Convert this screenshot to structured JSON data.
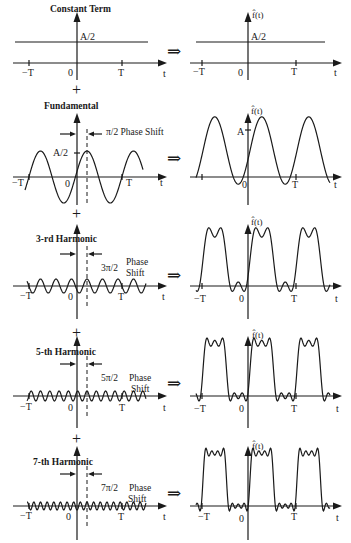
{
  "figure": {
    "colors": {
      "ink": "#1a1a1a",
      "background": "#ffffff"
    },
    "symbols": {
      "plus": "+",
      "implies": "⇒",
      "output_label": "f̂(t)",
      "axis_t": "t"
    },
    "ticks": {
      "neg_T": "−T",
      "zero": "0",
      "pos_T": "T"
    },
    "rows": [
      {
        "title": "Constant Term",
        "amp_label": "A/2",
        "right_amp_label": "A/2",
        "phase": "",
        "phase_word1": "",
        "phase_word2": "",
        "axis_y": 63
      },
      {
        "title": "Fundamental",
        "amp_label": "A/2",
        "right_amp_label": "A",
        "phase": "π/2 Phase Shift",
        "phase_word1": "",
        "phase_word2": "",
        "axis_y": 177
      },
      {
        "title": "3-rd Harmonic",
        "amp_label": "",
        "right_amp_label": "",
        "phase": "3π/2",
        "phase_word1": "Phase",
        "phase_word2": "Shift",
        "axis_y": 286
      },
      {
        "title": "5-th Harmonic",
        "amp_label": "",
        "right_amp_label": "",
        "phase": "5π/2",
        "phase_word1": "Phase",
        "phase_word2": "Shift",
        "axis_y": 396
      },
      {
        "title": "7-th Harmonic",
        "amp_label": "",
        "right_amp_label": "",
        "phase": "7π/2",
        "phase_word1": "Phase",
        "phase_word2": "Shift",
        "axis_y": 506
      }
    ]
  }
}
